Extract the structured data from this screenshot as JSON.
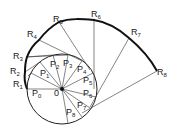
{
  "diagram": {
    "type": "involute-of-circle",
    "center_label": "O",
    "circle_points": [
      "P0",
      "P1",
      "P2",
      "P3",
      "P4",
      "P5",
      "P6",
      "P7",
      "P8"
    ],
    "involute_points": [
      "R1",
      "R2",
      "R3",
      "R4",
      "R5",
      "R6",
      "R7",
      "R8"
    ],
    "labels": [
      {
        "id": "R1",
        "text": "R",
        "sub": "1",
        "x": 13,
        "y": 80
      },
      {
        "id": "R2",
        "text": "R",
        "sub": "2",
        "x": 10,
        "y": 67
      },
      {
        "id": "R3",
        "text": "R",
        "sub": "3",
        "x": 13,
        "y": 52
      },
      {
        "id": "R4",
        "text": "R",
        "sub": "4",
        "x": 27,
        "y": 30
      },
      {
        "id": "R5",
        "text": "R",
        "sub": "5",
        "x": 53,
        "y": 15
      },
      {
        "id": "R6",
        "text": "R",
        "sub": "6",
        "x": 91,
        "y": 10
      },
      {
        "id": "R7",
        "text": "R",
        "sub": "7",
        "x": 131,
        "y": 28
      },
      {
        "id": "R8",
        "text": "R",
        "sub": "8",
        "x": 157,
        "y": 68
      },
      {
        "id": "P0",
        "text": "P",
        "sub": "0",
        "x": 32,
        "y": 89
      },
      {
        "id": "P1",
        "text": "P",
        "sub": "1",
        "x": 40,
        "y": 69
      },
      {
        "id": "P2",
        "text": "P",
        "sub": "2",
        "x": 50,
        "y": 60
      },
      {
        "id": "P3",
        "text": "P",
        "sub": "3",
        "x": 63,
        "y": 59
      },
      {
        "id": "P4",
        "text": "P",
        "sub": "4",
        "x": 77,
        "y": 65
      },
      {
        "id": "P5",
        "text": "P",
        "sub": "5",
        "x": 83,
        "y": 76
      },
      {
        "id": "P6",
        "text": "P",
        "sub": "6",
        "x": 83,
        "y": 89
      },
      {
        "id": "P7",
        "text": "P",
        "sub": "7",
        "x": 77,
        "y": 101
      },
      {
        "id": "P8",
        "text": "P",
        "sub": "8",
        "x": 66,
        "y": 108
      },
      {
        "id": "O",
        "text": "0",
        "sub": "",
        "x": 54,
        "y": 89
      }
    ]
  }
}
